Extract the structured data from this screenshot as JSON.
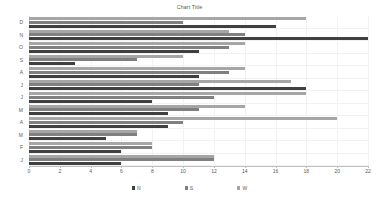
{
  "chart_data": {
    "type": "bar",
    "orientation": "horizontal",
    "title": "Chart Title",
    "xlabel": "",
    "ylabel": "",
    "xlim": [
      0,
      22
    ],
    "xticks": [
      0,
      2,
      4,
      6,
      8,
      10,
      12,
      14,
      16,
      18,
      20,
      22
    ],
    "xtick_labels": [
      "0",
      "2",
      "4",
      "6",
      "8",
      "10",
      "12",
      "14",
      "16",
      "18",
      "20",
      "22"
    ],
    "grid": true,
    "grid_axis": "x",
    "legend_position": "bottom",
    "categories": [
      "D",
      "N",
      "O",
      "S",
      "A",
      "J",
      "J",
      "M",
      "A",
      "M",
      "F",
      "J"
    ],
    "series": [
      {
        "name": "N",
        "color": "#404040",
        "values": [
          16,
          22,
          11,
          3,
          11,
          18,
          8,
          9,
          9,
          5,
          6,
          6
        ]
      },
      {
        "name": "S",
        "color": "#808080",
        "values": [
          10,
          14,
          13,
          7,
          13,
          11,
          12,
          11,
          10,
          7,
          8,
          12
        ]
      },
      {
        "name": "W",
        "color": "#a6a6a6",
        "values": [
          18,
          13,
          14,
          10,
          14,
          17,
          18,
          14,
          20,
          7,
          8,
          12
        ]
      }
    ]
  },
  "legend": {
    "items": [
      {
        "label": "N",
        "color": "#404040"
      },
      {
        "label": "S",
        "color": "#808080"
      },
      {
        "label": "W",
        "color": "#a6a6a6"
      }
    ]
  },
  "colors": {
    "series_n": "#404040",
    "series_s": "#808080",
    "series_w": "#a6a6a6",
    "gridline": "#f2f2f2",
    "axis": "#bfbfbf",
    "text": "#595959",
    "background": "#ffffff"
  }
}
